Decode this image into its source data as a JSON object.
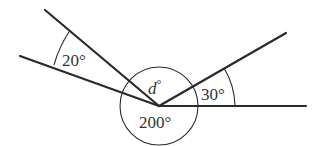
{
  "diagram": {
    "type": "angles-at-a-point",
    "vertex": {
      "x": 159,
      "y": 106
    },
    "rays": [
      {
        "name": "upper-left-ray",
        "to": {
          "x": 45,
          "y": 10
        }
      },
      {
        "name": "lower-left-ray",
        "to": {
          "x": 20,
          "y": 56
        }
      },
      {
        "name": "upper-right-ray",
        "to": {
          "x": 286,
          "y": 33
        }
      },
      {
        "name": "horizontal-right-ray",
        "to": {
          "x": 306,
          "y": 106
        }
      }
    ],
    "labels": {
      "angle_20": "20°",
      "angle_d": "d°",
      "angle_d_var": "d",
      "angle_d_deg": "°",
      "angle_30": "30°",
      "angle_200": "200°"
    },
    "colors": {
      "stroke": "#2a2a2a",
      "text": "#333333",
      "background": "#ffffff"
    }
  }
}
